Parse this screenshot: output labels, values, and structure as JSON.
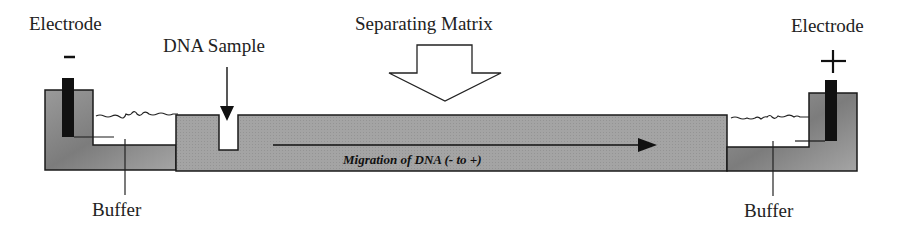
{
  "labels": {
    "electrode_left": "Electrode",
    "electrode_left_sign": "-",
    "electrode_right": "Electrode",
    "electrode_right_sign": "+",
    "dna_sample": "DNA Sample",
    "separating_matrix": "Separating Matrix",
    "buffer_left": "Buffer",
    "buffer_right": "Buffer",
    "migration": "Migration of DNA (- to +)"
  },
  "colors": {
    "tank": "#8a8a8a",
    "gel": "#a3a3a3",
    "electrode": "#111111",
    "outline": "#1a1a1a"
  }
}
